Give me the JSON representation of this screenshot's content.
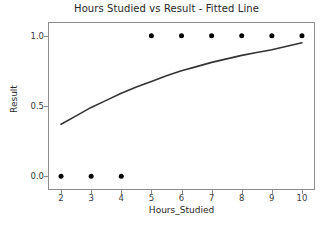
{
  "chart_data": {
    "type": "scatter",
    "title": "Hours Studied vs Result - Fitted Line",
    "xlabel": "Hours_Studied",
    "ylabel": "Result",
    "xlim": [
      1.6,
      10.4
    ],
    "ylim": [
      -0.09,
      1.09
    ],
    "grid": false,
    "legend": null,
    "xticks": [
      2,
      3,
      4,
      5,
      6,
      7,
      8,
      9,
      10
    ],
    "xtick_labels": [
      "2",
      "3",
      "4",
      "5",
      "6",
      "7",
      "8",
      "9",
      "10"
    ],
    "yticks": [
      0.0,
      0.5,
      1.0
    ],
    "ytick_labels": [
      "0.0",
      "0.5",
      "1.0"
    ],
    "series": [
      {
        "name": "Observed data",
        "type": "scatter",
        "marker": "circle",
        "color": "#000000",
        "marker_size": 5,
        "x": [
          2,
          3,
          4,
          5,
          6,
          7,
          8,
          9,
          10
        ],
        "y": [
          0.0,
          0.0,
          0.0,
          1.0,
          1.0,
          1.0,
          1.0,
          1.0,
          1.0
        ]
      },
      {
        "name": "Fitted Line",
        "type": "line",
        "color": "#333333",
        "line_width": 1.6,
        "x": [
          2.0,
          2.5,
          3.0,
          3.5,
          4.0,
          4.5,
          5.0,
          5.5,
          6.0,
          6.5,
          7.0,
          7.5,
          8.0,
          8.5,
          9.0,
          9.5,
          10.0
        ],
        "y": [
          0.37,
          0.43,
          0.49,
          0.54,
          0.59,
          0.635,
          0.675,
          0.715,
          0.75,
          0.78,
          0.81,
          0.835,
          0.86,
          0.88,
          0.9,
          0.925,
          0.95
        ]
      }
    ]
  }
}
